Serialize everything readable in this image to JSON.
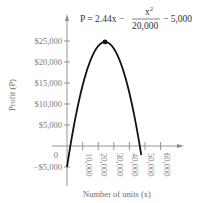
{
  "chart_data": {
    "type": "line",
    "title": "",
    "equation": {
      "lhs": "P = 2.44x −",
      "frac_num": "x",
      "frac_num_exp": "2",
      "frac_den": "20,000",
      "rhs": "− 5,000"
    },
    "xlabel": "Number of units (x)",
    "ylabel": "Profit (P)",
    "x_ticks": [
      {
        "value": 10000,
        "label": "10,000"
      },
      {
        "value": 20000,
        "label": "20,000"
      },
      {
        "value": 30000,
        "label": "30,000"
      },
      {
        "value": 40000,
        "label": "40,000"
      },
      {
        "value": 50000,
        "label": "50,000"
      },
      {
        "value": 60000,
        "label": "60,000"
      }
    ],
    "y_ticks": [
      {
        "value": 25000,
        "label": "$25,000"
      },
      {
        "value": 20000,
        "label": "$20,000"
      },
      {
        "value": 15000,
        "label": "$15,000"
      },
      {
        "value": 10000,
        "label": "$10,000"
      },
      {
        "value": 5000,
        "label": "$5,000"
      },
      {
        "value": 0,
        "label": "0"
      },
      {
        "value": -5000,
        "label": "−$5,000"
      }
    ],
    "xlim": [
      0,
      60000
    ],
    "ylim": [
      -5000,
      25000
    ],
    "grid": false,
    "legend": null,
    "series": [
      {
        "name": "P = 2.44x − x^2/20,000 − 5,000",
        "x": [
          0,
          2088,
          5000,
          10000,
          15000,
          20000,
          24400,
          30000,
          35000,
          40000,
          45000,
          46712
        ],
        "values": [
          -5000,
          0,
          5950,
          14400,
          20350,
          23800,
          24768,
          23200,
          18150,
          9600,
          -2450,
          0
        ]
      }
    ],
    "annotations": [
      {
        "type": "point",
        "label": "maximum",
        "x": 24400,
        "y": 24768
      }
    ]
  }
}
